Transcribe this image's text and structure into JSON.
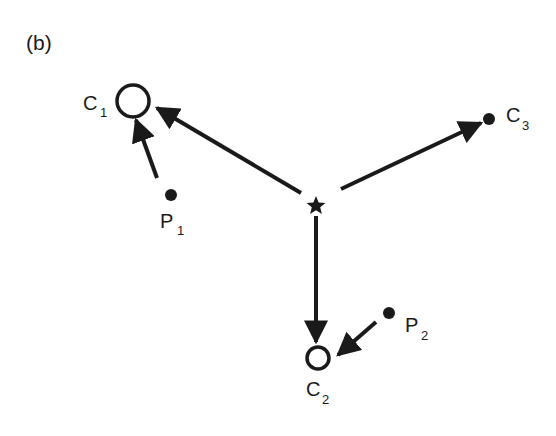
{
  "panel_label": "(b)",
  "colors": {
    "ink": "#1a1a1a",
    "background": "#ffffff"
  },
  "nodes": {
    "star": {
      "name": "star",
      "x": 316,
      "y": 205
    },
    "C1": {
      "label": "C",
      "sub": "1",
      "x": 133,
      "y": 101,
      "shape": "open-circle"
    },
    "C2": {
      "label": "C",
      "sub": "2",
      "x": 318,
      "y": 358,
      "shape": "open-circle"
    },
    "C3": {
      "label": "C",
      "sub": "3",
      "x": 489,
      "y": 119,
      "shape": "filled-dot"
    },
    "P1": {
      "label": "P",
      "sub": "1",
      "x": 171,
      "y": 195,
      "shape": "filled-dot"
    },
    "P2": {
      "label": "P",
      "sub": "2",
      "x": 389,
      "y": 313,
      "shape": "filled-dot"
    }
  },
  "edges": [
    {
      "from": "star",
      "to": "C1"
    },
    {
      "from": "star",
      "to": "C3"
    },
    {
      "from": "star",
      "to": "C2"
    },
    {
      "from": "P1",
      "to": "C1"
    },
    {
      "from": "P2",
      "to": "C2"
    }
  ]
}
